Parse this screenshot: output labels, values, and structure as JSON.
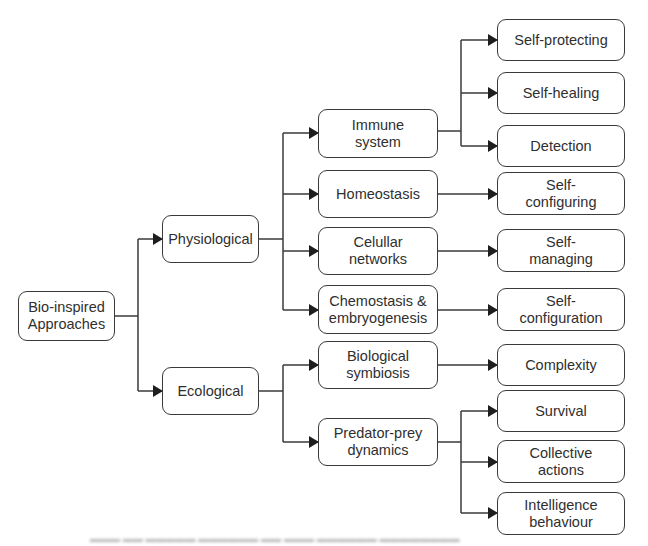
{
  "diagram": {
    "type": "tree",
    "colors": {
      "stroke": "#3a3a3a",
      "text": "#2f2f2f",
      "background": "#ffffff"
    },
    "root": {
      "label": "Bio-inspired\nApproaches"
    },
    "level1": [
      {
        "label": "Physiological"
      },
      {
        "label": "Ecological"
      }
    ],
    "level2": [
      {
        "label": "Immune\nsystem",
        "parent": "Physiological"
      },
      {
        "label": "Homeostasis",
        "parent": "Physiological"
      },
      {
        "label": "Celullar\nnetworks",
        "parent": "Physiological"
      },
      {
        "label": "Chemostasis &\nembryogenesis",
        "parent": "Physiological"
      },
      {
        "label": "Biological\nsymbiosis",
        "parent": "Ecological"
      },
      {
        "label": "Predator-prey\ndynamics",
        "parent": "Ecological"
      }
    ],
    "level3": [
      {
        "label": "Self-protecting",
        "parent": "Immune system"
      },
      {
        "label": "Self-healing",
        "parent": "Immune system"
      },
      {
        "label": "Detection",
        "parent": "Immune system"
      },
      {
        "label": "Self-\nconfiguring",
        "parent": "Homeostasis"
      },
      {
        "label": "Self-\nmanaging",
        "parent": "Celullar networks"
      },
      {
        "label": "Self-\nconfiguration",
        "parent": "Chemostasis & embryogenesis"
      },
      {
        "label": "Complexity",
        "parent": "Biological symbiosis"
      },
      {
        "label": "Survival",
        "parent": "Predator-prey dynamics"
      },
      {
        "label": "Collective\nactions",
        "parent": "Predator-prey dynamics"
      },
      {
        "label": "Intelligence\nbehaviour",
        "parent": "Predator-prey dynamics"
      }
    ]
  }
}
